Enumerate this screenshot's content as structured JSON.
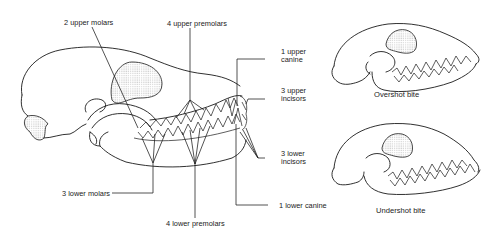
{
  "figure": {
    "main_skull": {
      "title": "Dog skull dentition (lateral view)",
      "labels": {
        "upper_molars": "2 upper molars",
        "upper_premolars": "4 upper premolars",
        "upper_canine_line1": "1 upper",
        "upper_canine_line2": "canine",
        "upper_incisors_line1": "3 upper",
        "upper_incisors_line2": "incisors",
        "lower_incisors_line1": "3 lower",
        "lower_incisors_line2": "incisors",
        "lower_canine": "1 lower canine",
        "lower_molars": "3 lower molars",
        "lower_premolars": "4 lower premolars"
      }
    },
    "overshot": {
      "caption": "Overshot bite"
    },
    "undershot": {
      "caption": "Undershot bite"
    },
    "colors": {
      "ink": "#1a1a1a",
      "background": "#ffffff",
      "stipple": "#9a9a9a"
    }
  }
}
